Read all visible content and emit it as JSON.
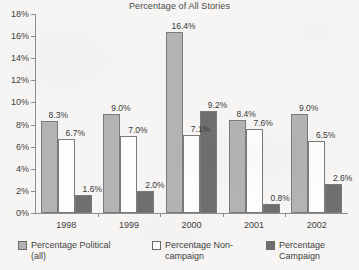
{
  "chart_data": {
    "type": "bar",
    "title": "Percentage of All Stories",
    "xlabel": "",
    "ylabel": "",
    "categories": [
      "1998",
      "1999",
      "2000",
      "2001",
      "2002"
    ],
    "series": [
      {
        "name": "Percentage Political (all)",
        "legend_label": "Percentage Political\n(all)",
        "color": "#b3b3b3",
        "values": [
          8.3,
          9.0,
          16.4,
          8.4,
          9.0
        ],
        "labels": [
          "8.3%",
          "9.0%",
          "16.4%",
          "8.4%",
          "9.0%"
        ]
      },
      {
        "name": "Percentage Non-campaign",
        "legend_label": "Percentage Non-\ncampaign",
        "color": "#fdfdfc",
        "values": [
          6.7,
          7.0,
          7.1,
          7.6,
          6.5
        ],
        "labels": [
          "6.7%",
          "7.0%",
          "7.1%",
          "7.6%",
          "6.5%"
        ]
      },
      {
        "name": "Percentage Campaign",
        "legend_label": "Percentage\nCampaign",
        "color": "#6f6f6f",
        "values": [
          1.6,
          2.0,
          9.2,
          0.8,
          2.6
        ],
        "labels": [
          "1.6%",
          "2.0%",
          "9.2%",
          "0.8%",
          "2.6%"
        ]
      }
    ],
    "ylim": [
      0,
      18
    ],
    "ytick_step": 2,
    "ytick_labels": [
      "0%",
      "2%",
      "4%",
      "6%",
      "8%",
      "10%",
      "12%",
      "14%",
      "16%",
      "18%"
    ],
    "ytick_values": [
      0,
      2,
      4,
      6,
      8,
      10,
      12,
      14,
      16,
      18
    ],
    "grid": false,
    "legend_position": "bottom"
  }
}
